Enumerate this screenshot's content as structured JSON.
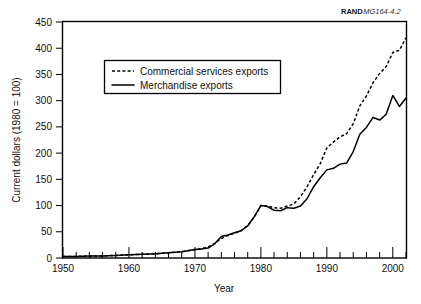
{
  "figure": {
    "credit_bold": "RAND",
    "credit_italic": "MG164-4.2"
  },
  "chart_data": {
    "type": "line",
    "title": "",
    "xlabel": "Year",
    "ylabel": "Current dollars (1980 = 100)",
    "xlim": [
      1950,
      2002
    ],
    "ylim": [
      0,
      450
    ],
    "yticks": [
      0,
      50,
      100,
      150,
      200,
      250,
      300,
      350,
      400,
      450
    ],
    "ytick_labels": [
      "0",
      "50",
      "100",
      "150",
      "200",
      "250",
      "300",
      "350",
      "400",
      "450"
    ],
    "xticks_major": [
      1950,
      1960,
      1970,
      1980,
      1990,
      2000
    ],
    "xtick_labels": [
      "1950",
      "1960",
      "1970",
      "1980",
      "1990",
      "2000"
    ],
    "xticks_minor_step": 2,
    "grid": false,
    "legend_position": "upper-left-inset",
    "series": [
      {
        "name": "Commercial services exports",
        "style": "dashed",
        "color": "#000000",
        "x": [
          1950,
          1952,
          1954,
          1956,
          1958,
          1960,
          1962,
          1964,
          1966,
          1968,
          1970,
          1971,
          1972,
          1973,
          1974,
          1975,
          1976,
          1977,
          1978,
          1979,
          1980,
          1981,
          1982,
          1983,
          1984,
          1985,
          1986,
          1987,
          1988,
          1989,
          1990,
          1991,
          1992,
          1993,
          1994,
          1995,
          1996,
          1997,
          1998,
          1999,
          2000,
          2001,
          2002
        ],
        "values": [
          3,
          3,
          4,
          4,
          5,
          6,
          7,
          8,
          10,
          12,
          16,
          18,
          21,
          28,
          37,
          43,
          47,
          52,
          62,
          78,
          100,
          99,
          96,
          95,
          99,
          103,
          117,
          136,
          159,
          180,
          210,
          221,
          231,
          237,
          256,
          290,
          309,
          334,
          352,
          365,
          392,
          396,
          420
        ]
      },
      {
        "name": "Merchandise exports",
        "style": "solid",
        "color": "#000000",
        "x": [
          1950,
          1952,
          1954,
          1956,
          1958,
          1960,
          1962,
          1964,
          1966,
          1968,
          1970,
          1971,
          1972,
          1973,
          1974,
          1975,
          1976,
          1977,
          1978,
          1979,
          1980,
          1981,
          1982,
          1983,
          1984,
          1985,
          1986,
          1987,
          1988,
          1989,
          1990,
          1991,
          1992,
          1993,
          1994,
          1995,
          1996,
          1997,
          1998,
          1999,
          2000,
          2001,
          2002
        ],
        "values": [
          3,
          3,
          4,
          4,
          5,
          6,
          7,
          8,
          10,
          12,
          16,
          17,
          19,
          27,
          41,
          44,
          48,
          52,
          61,
          79,
          100,
          98,
          91,
          90,
          96,
          95,
          99,
          113,
          136,
          153,
          168,
          171,
          179,
          181,
          203,
          236,
          249,
          268,
          263,
          274,
          310,
          289,
          305
        ]
      }
    ]
  }
}
